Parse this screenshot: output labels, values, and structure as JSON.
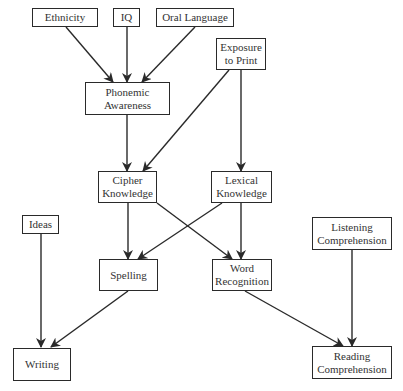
{
  "diagram": {
    "type": "flowchart",
    "nodes": {
      "ethnicity": {
        "label": "Ethnicity"
      },
      "iq": {
        "label": "IQ"
      },
      "oral_language": {
        "label": "Oral Language"
      },
      "exposure_to_print": {
        "label": "Exposure\nto Print"
      },
      "phonemic_awareness": {
        "label": "Phonemic\nAwareness"
      },
      "cipher_knowledge": {
        "label": "Cipher\nKnowledge"
      },
      "lexical_knowledge": {
        "label": "Lexical\nKnowledge"
      },
      "ideas": {
        "label": "Ideas"
      },
      "listening_comprehension": {
        "label": "Listening\nComprehension"
      },
      "spelling": {
        "label": "Spelling"
      },
      "word_recognition": {
        "label": "Word\nRecognition"
      },
      "writing": {
        "label": "Writing"
      },
      "reading_comprehension": {
        "label": "Reading\nComprehension"
      }
    },
    "edges": [
      {
        "from": "Ethnicity",
        "to": "Phonemic Awareness"
      },
      {
        "from": "IQ",
        "to": "Phonemic Awareness"
      },
      {
        "from": "Oral Language",
        "to": "Phonemic Awareness"
      },
      {
        "from": "Phonemic Awareness",
        "to": "Cipher Knowledge"
      },
      {
        "from": "Exposure to Print",
        "to": "Cipher Knowledge"
      },
      {
        "from": "Exposure to Print",
        "to": "Lexical Knowledge"
      },
      {
        "from": "Cipher Knowledge",
        "to": "Spelling"
      },
      {
        "from": "Cipher Knowledge",
        "to": "Word Recognition"
      },
      {
        "from": "Lexical Knowledge",
        "to": "Spelling"
      },
      {
        "from": "Lexical Knowledge",
        "to": "Word Recognition"
      },
      {
        "from": "Ideas",
        "to": "Writing"
      },
      {
        "from": "Spelling",
        "to": "Writing"
      },
      {
        "from": "Word Recognition",
        "to": "Reading Comprehension"
      },
      {
        "from": "Listening Comprehension",
        "to": "Reading Comprehension"
      }
    ],
    "colors": {
      "stroke": "#2a2a2a",
      "text": "#333333",
      "background": "#ffffff"
    }
  }
}
